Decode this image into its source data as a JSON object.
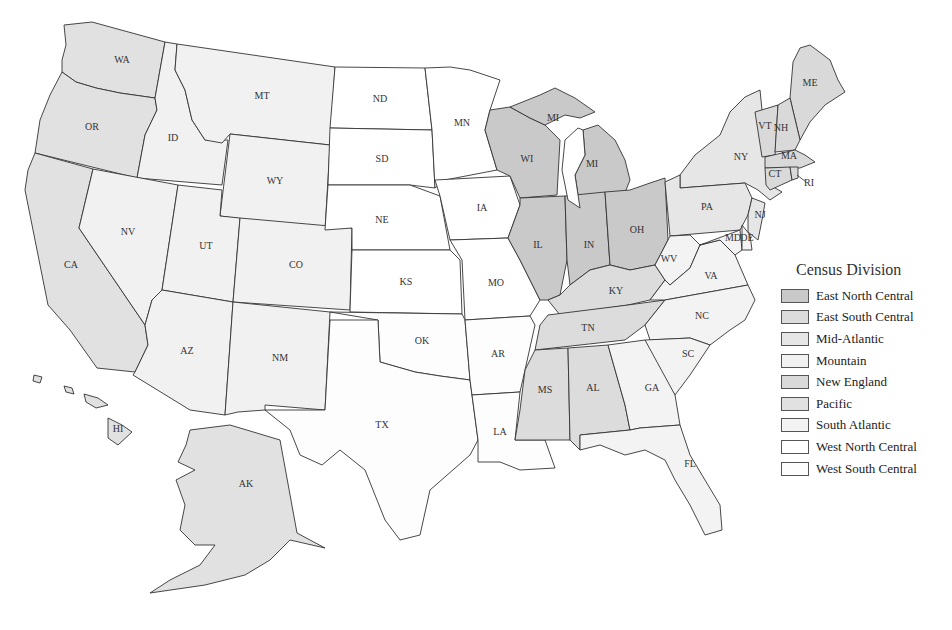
{
  "legend": {
    "title": "Census Division",
    "items": [
      {
        "label": "East North Central",
        "color": "#c9c9c9"
      },
      {
        "label": "East South Central",
        "color": "#dcdcdc"
      },
      {
        "label": "Mid-Atlantic",
        "color": "#e6e6e6"
      },
      {
        "label": "Mountain",
        "color": "#f1f1f1"
      },
      {
        "label": "New England",
        "color": "#d9d9d9"
      },
      {
        "label": "Pacific",
        "color": "#e1e1e1"
      },
      {
        "label": "South Atlantic",
        "color": "#f3f3f3"
      },
      {
        "label": "West North Central",
        "color": "#ffffff"
      },
      {
        "label": "West South Central",
        "color": "#fdfdfd"
      }
    ]
  },
  "states": [
    {
      "abbr": "WA",
      "division": "Pacific",
      "label_x": 122,
      "label_y": 61
    },
    {
      "abbr": "OR",
      "division": "Pacific",
      "label_x": 92,
      "label_y": 128
    },
    {
      "abbr": "CA",
      "division": "Pacific",
      "label_x": 71,
      "label_y": 266
    },
    {
      "abbr": "AK",
      "division": "Pacific",
      "label_x": 246,
      "label_y": 485
    },
    {
      "abbr": "HI",
      "division": "Pacific",
      "label_x": 118,
      "label_y": 430
    },
    {
      "abbr": "ID",
      "division": "Mountain",
      "label_x": 173,
      "label_y": 139
    },
    {
      "abbr": "MT",
      "division": "Mountain",
      "label_x": 262,
      "label_y": 97
    },
    {
      "abbr": "WY",
      "division": "Mountain",
      "label_x": 275,
      "label_y": 182
    },
    {
      "abbr": "NV",
      "division": "Mountain",
      "label_x": 128,
      "label_y": 233
    },
    {
      "abbr": "UT",
      "division": "Mountain",
      "label_x": 206,
      "label_y": 247
    },
    {
      "abbr": "CO",
      "division": "Mountain",
      "label_x": 296,
      "label_y": 266
    },
    {
      "abbr": "AZ",
      "division": "Mountain",
      "label_x": 187,
      "label_y": 352
    },
    {
      "abbr": "NM",
      "division": "Mountain",
      "label_x": 280,
      "label_y": 359
    },
    {
      "abbr": "ND",
      "division": "West North Central",
      "label_x": 380,
      "label_y": 100
    },
    {
      "abbr": "SD",
      "division": "West North Central",
      "label_x": 382,
      "label_y": 160
    },
    {
      "abbr": "NE",
      "division": "West North Central",
      "label_x": 382,
      "label_y": 221
    },
    {
      "abbr": "KS",
      "division": "West North Central",
      "label_x": 406,
      "label_y": 283
    },
    {
      "abbr": "MN",
      "division": "West North Central",
      "label_x": 462,
      "label_y": 124
    },
    {
      "abbr": "IA",
      "division": "West North Central",
      "label_x": 482,
      "label_y": 209
    },
    {
      "abbr": "MO",
      "division": "West North Central",
      "label_x": 496,
      "label_y": 284
    },
    {
      "abbr": "OK",
      "division": "West South Central",
      "label_x": 422,
      "label_y": 342
    },
    {
      "abbr": "TX",
      "division": "West South Central",
      "label_x": 382,
      "label_y": 426
    },
    {
      "abbr": "AR",
      "division": "West South Central",
      "label_x": 498,
      "label_y": 355
    },
    {
      "abbr": "LA",
      "division": "West South Central",
      "label_x": 500,
      "label_y": 433
    },
    {
      "abbr": "WI",
      "division": "East North Central",
      "label_x": 527,
      "label_y": 160
    },
    {
      "abbr": "MI",
      "division": "East North Central",
      "label_x": 553,
      "label_y": 119
    },
    {
      "abbr": "MI",
      "division": "East North Central",
      "label_x": 592,
      "label_y": 165
    },
    {
      "abbr": "IL",
      "division": "East North Central",
      "label_x": 538,
      "label_y": 246
    },
    {
      "abbr": "IN",
      "division": "East North Central",
      "label_x": 589,
      "label_y": 246
    },
    {
      "abbr": "OH",
      "division": "East North Central",
      "label_x": 637,
      "label_y": 231
    },
    {
      "abbr": "KY",
      "division": "East South Central",
      "label_x": 616,
      "label_y": 292
    },
    {
      "abbr": "TN",
      "division": "East South Central",
      "label_x": 588,
      "label_y": 329
    },
    {
      "abbr": "MS",
      "division": "East South Central",
      "label_x": 545,
      "label_y": 391
    },
    {
      "abbr": "AL",
      "division": "East South Central",
      "label_x": 593,
      "label_y": 389
    },
    {
      "abbr": "NY",
      "division": "Mid-Atlantic",
      "label_x": 741,
      "label_y": 158
    },
    {
      "abbr": "PA",
      "division": "Mid-Atlantic",
      "label_x": 707,
      "label_y": 208
    },
    {
      "abbr": "NJ",
      "division": "Mid-Atlantic",
      "label_x": 760,
      "label_y": 216
    },
    {
      "abbr": "WV",
      "division": "South Atlantic",
      "label_x": 669,
      "label_y": 260
    },
    {
      "abbr": "VA",
      "division": "South Atlantic",
      "label_x": 711,
      "label_y": 277
    },
    {
      "abbr": "MD",
      "division": "South Atlantic",
      "label_x": 733,
      "label_y": 239
    },
    {
      "abbr": "DE",
      "division": "South Atlantic",
      "label_x": 747,
      "label_y": 239
    },
    {
      "abbr": "NC",
      "division": "South Atlantic",
      "label_x": 702,
      "label_y": 317
    },
    {
      "abbr": "SC",
      "division": "South Atlantic",
      "label_x": 688,
      "label_y": 355
    },
    {
      "abbr": "GA",
      "division": "South Atlantic",
      "label_x": 652,
      "label_y": 389
    },
    {
      "abbr": "FL",
      "division": "South Atlantic",
      "label_x": 690,
      "label_y": 465
    },
    {
      "abbr": "ME",
      "division": "New England",
      "label_x": 810,
      "label_y": 84
    },
    {
      "abbr": "VT",
      "division": "New England",
      "label_x": 765,
      "label_y": 127
    },
    {
      "abbr": "NH",
      "division": "New England",
      "label_x": 781,
      "label_y": 129
    },
    {
      "abbr": "MA",
      "division": "New England",
      "label_x": 789,
      "label_y": 157
    },
    {
      "abbr": "CT",
      "division": "New England",
      "label_x": 775,
      "label_y": 175
    },
    {
      "abbr": "RI",
      "division": "New England",
      "label_x": 809,
      "label_y": 184
    }
  ]
}
